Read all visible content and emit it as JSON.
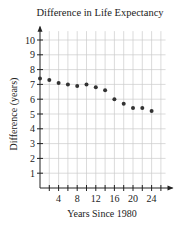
{
  "chart_data": {
    "type": "scatter",
    "title": "Difference in Life Expectancy",
    "xlabel": "Years Since 1980",
    "ylabel": "Difference (years)",
    "x": [
      0,
      2,
      4,
      6,
      8,
      10,
      12,
      14,
      16,
      18,
      20,
      22,
      24
    ],
    "series": [
      {
        "name": "Difference in Life Expectancy",
        "values": [
          7.4,
          7.3,
          7.1,
          7.0,
          6.9,
          7.0,
          6.8,
          6.6,
          6.0,
          5.7,
          5.4,
          5.4,
          5.2
        ]
      }
    ],
    "xlim": [
      0,
      27
    ],
    "ylim": [
      0,
      10.7
    ],
    "x_tick_labels": [
      "4",
      "8",
      "12",
      "16",
      "20",
      "24"
    ],
    "x_tick_values": [
      4,
      8,
      12,
      16,
      20,
      24
    ],
    "y_tick_labels": [
      "1",
      "2",
      "3",
      "4",
      "5",
      "6",
      "7",
      "8",
      "9",
      "10"
    ],
    "y_tick_values": [
      1,
      2,
      3,
      4,
      5,
      6,
      7,
      8,
      9,
      10
    ],
    "grid": true,
    "legend": "none",
    "colors": {
      "point": "#333333",
      "grid": "#cccccc",
      "axis": "#222222"
    }
  }
}
